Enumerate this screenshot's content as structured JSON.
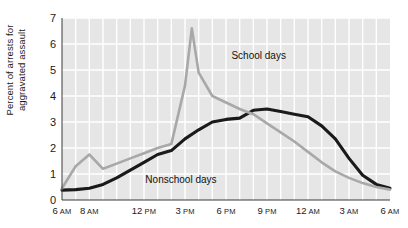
{
  "chart_data": {
    "type": "line",
    "title": "",
    "xlabel": "",
    "ylabel": "Percent of arrests for\naggravated assault",
    "ylim": [
      0,
      7
    ],
    "yticks": [
      0,
      1,
      2,
      3,
      4,
      5,
      6,
      7
    ],
    "ytick_labels": [
      "0",
      "1",
      "2",
      "3",
      "4",
      "5",
      "6",
      "7"
    ],
    "xtick_labels": [
      {
        "hour": "6",
        "ampm": "AM"
      },
      {
        "hour": "8",
        "ampm": "AM"
      },
      {
        "hour": "12",
        "ampm": "PM"
      },
      {
        "hour": "3",
        "ampm": "PM"
      },
      {
        "hour": "6",
        "ampm": "PM"
      },
      {
        "hour": "9",
        "ampm": "PM"
      },
      {
        "hour": "12",
        "ampm": "AM"
      },
      {
        "hour": "3",
        "ampm": "AM"
      },
      {
        "hour": "6",
        "ampm": "AM"
      }
    ],
    "xtick_hours": [
      6,
      8,
      12,
      15,
      18,
      21,
      24,
      27,
      30
    ],
    "x_range_hours": [
      6,
      30
    ],
    "grid": true,
    "grid_color": "#ffffff",
    "plot_background": "#e6e6e6",
    "legend_position": "inline-annotations",
    "series": [
      {
        "name": "School days",
        "color": "#a8a8a8",
        "label_x_hour": 18.4,
        "label_y_value": 5.55,
        "x": [
          6,
          7,
          8,
          9,
          10,
          11,
          12,
          13,
          14,
          15,
          15.5,
          16,
          17,
          18,
          19,
          20,
          21,
          22,
          23,
          24,
          25,
          26,
          27,
          28,
          29,
          30
        ],
        "values": [
          0.45,
          1.3,
          1.75,
          1.2,
          1.4,
          1.6,
          1.8,
          2.0,
          2.15,
          4.4,
          6.6,
          4.9,
          4.0,
          3.75,
          3.5,
          3.3,
          2.95,
          2.6,
          2.25,
          1.85,
          1.45,
          1.1,
          0.85,
          0.65,
          0.5,
          0.4
        ]
      },
      {
        "name": "Nonschool days",
        "color": "#1a1a1a",
        "label_x_hour": 12.1,
        "label_y_value": 0.78,
        "x": [
          6,
          7,
          8,
          9,
          10,
          11,
          12,
          13,
          14,
          15,
          16,
          17,
          18,
          19,
          20,
          21,
          22,
          23,
          24,
          25,
          26,
          27,
          28,
          29,
          30
        ],
        "values": [
          0.38,
          0.4,
          0.45,
          0.6,
          0.85,
          1.15,
          1.45,
          1.75,
          1.9,
          2.35,
          2.7,
          3.0,
          3.1,
          3.15,
          3.45,
          3.5,
          3.4,
          3.3,
          3.2,
          2.85,
          2.35,
          1.6,
          0.95,
          0.6,
          0.45
        ]
      }
    ]
  }
}
